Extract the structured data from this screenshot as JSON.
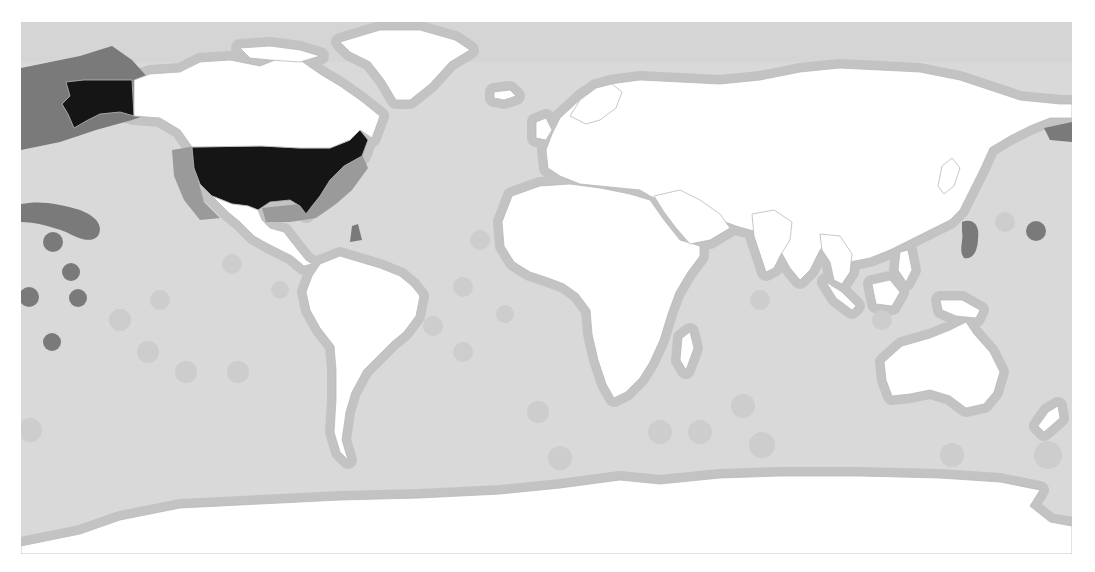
{
  "map": {
    "type": "choropleth-world-map",
    "projection": "equirectangular",
    "frame": {
      "x": 21,
      "y": 22,
      "width": 1051,
      "height": 532
    },
    "colors": {
      "page_background": "#ffffff",
      "ocean_base": "#d9d9d9",
      "arctic_band": "#d2d2d2",
      "eez_light": "#cdcdcd",
      "eez_mid": "#c3c3c3",
      "eez_medium_dark": "#9a9a9a",
      "eez_dark": "#7a7a7a",
      "highlight_land": "#151515",
      "land": "#ffffff",
      "border": "#b9b9b9"
    },
    "legend": null,
    "highlighted_country": "United States",
    "zones": [
      {
        "id": "us-alaska-eez",
        "label": "Alaska EEZ",
        "shade": "eez_dark",
        "d": "M21,68 L80,56 L112,46 L132,60 L150,80 L166,96 L160,110 L132,120 L96,130 L60,142 L21,150 Z"
      },
      {
        "id": "us-west-coast-eez",
        "label": "US West Coast EEZ",
        "shade": "eez_medium_dark",
        "d": "M172,150 L196,146 L198,180 L204,202 L220,218 L200,220 L184,200 L174,176 Z"
      },
      {
        "id": "us-gulf-east-eez",
        "label": "US Gulf & East Coast EEZ",
        "shade": "eez_medium_dark",
        "d": "M262,208 L300,204 L320,196 L330,176 L346,160 L360,150 L368,168 L352,190 L336,204 L316,218 L290,222 L266,222 Z"
      },
      {
        "id": "hawaii-chain-eez",
        "label": "Hawaiian chain EEZ",
        "shade": "eez_dark",
        "d": "M21,204 C40,200 60,204 80,210 C96,216 104,226 98,236 C90,244 78,238 66,232 C50,226 34,222 21,222 Z"
      },
      {
        "id": "puerto-rico-eez",
        "label": "Puerto Rico EEZ",
        "shade": "eez_dark",
        "d": "M352,226 L358,224 L362,240 L350,242 Z"
      },
      {
        "id": "guam-marianas-eez",
        "label": "Guam / Marianas EEZ",
        "shade": "eez_dark",
        "d": "M962,222 C972,218 980,224 978,238 C978,252 972,260 964,258 C958,250 964,240 962,232 Z"
      },
      {
        "id": "bering-eez",
        "label": "Aleutian / Bering EEZ",
        "shade": "eez_dark",
        "d": "M1044,128 L1072,122 L1072,142 L1050,140 Z"
      }
    ],
    "circles": [
      {
        "id": "wake-island",
        "cx": 1036,
        "cy": 231,
        "r": 10,
        "shade": "eez_dark"
      },
      {
        "id": "johnston-atoll",
        "cx": 53,
        "cy": 242,
        "r": 10,
        "shade": "eez_dark"
      },
      {
        "id": "kingman-palmyra",
        "cx": 71,
        "cy": 272,
        "r": 9,
        "shade": "eez_dark"
      },
      {
        "id": "howland-baker",
        "cx": 29,
        "cy": 297,
        "r": 10,
        "shade": "eez_dark"
      },
      {
        "id": "jarvis-island",
        "cx": 78,
        "cy": 298,
        "r": 9,
        "shade": "eez_dark"
      },
      {
        "id": "american-samoa",
        "cx": 52,
        "cy": 342,
        "r": 9,
        "shade": "eez_dark"
      }
    ],
    "light_circles": [
      {
        "cx": 300,
        "cy": 187,
        "r": 12
      },
      {
        "cx": 232,
        "cy": 264,
        "r": 10
      },
      {
        "cx": 280,
        "cy": 290,
        "r": 9
      },
      {
        "cx": 463,
        "cy": 287,
        "r": 10
      },
      {
        "cx": 505,
        "cy": 314,
        "r": 9
      },
      {
        "cx": 463,
        "cy": 352,
        "r": 10
      },
      {
        "cx": 538,
        "cy": 412,
        "r": 11
      },
      {
        "cx": 433,
        "cy": 326,
        "r": 10
      },
      {
        "cx": 238,
        "cy": 372,
        "r": 11
      },
      {
        "cx": 148,
        "cy": 352,
        "r": 11
      },
      {
        "cx": 186,
        "cy": 372,
        "r": 11
      },
      {
        "cx": 660,
        "cy": 432,
        "r": 12
      },
      {
        "cx": 700,
        "cy": 432,
        "r": 12
      },
      {
        "cx": 743,
        "cy": 406,
        "r": 12
      },
      {
        "cx": 762,
        "cy": 445,
        "r": 13
      },
      {
        "cx": 1005,
        "cy": 222,
        "r": 10
      },
      {
        "cx": 882,
        "cy": 320,
        "r": 10
      },
      {
        "cx": 952,
        "cy": 455,
        "r": 12
      },
      {
        "cx": 1048,
        "cy": 455,
        "r": 14
      },
      {
        "cx": 560,
        "cy": 458,
        "r": 12
      },
      {
        "cx": 760,
        "cy": 300,
        "r": 10
      },
      {
        "cx": 620,
        "cy": 290,
        "r": 10
      },
      {
        "cx": 480,
        "cy": 240,
        "r": 10
      },
      {
        "cx": 30,
        "cy": 430,
        "r": 12
      },
      {
        "cx": 120,
        "cy": 320,
        "r": 11
      },
      {
        "cx": 160,
        "cy": 300,
        "r": 10
      }
    ],
    "land": [
      {
        "id": "usa-contiguous",
        "name": "United States",
        "highlight": true,
        "d": "M192,147 L262,146 L300,148 L330,148 L350,140 L360,130 L368,140 L362,156 L344,166 L330,180 L320,196 L312,206 L306,214 L300,206 L290,200 L270,202 L258,210 L248,206 L232,204 L212,196 L200,184 L194,168 Z"
      },
      {
        "id": "usa-alaska",
        "name": "Alaska",
        "highlight": true,
        "d": "M66,82 L84,80 L132,80 L134,116 L120,112 L100,114 L88,120 L74,128 L68,114 L62,104 L70,96 Z"
      },
      {
        "id": "canada",
        "name": "Canada",
        "highlight": false,
        "d": "M134,80 L150,74 L180,72 L200,62 L230,60 L260,66 L280,58 L300,60 L320,74 L340,86 L360,100 L380,116 L372,138 L360,130 L350,140 L330,148 L300,148 L262,146 L192,147 L180,130 L160,118 L134,116 Z"
      },
      {
        "id": "canada-arctic-islands",
        "name": "Canadian Arctic Archipelago",
        "highlight": false,
        "d": "M240,48 L270,46 L300,50 L320,56 L300,62 L270,60 L250,58 Z"
      },
      {
        "id": "greenland",
        "name": "Greenland",
        "highlight": false,
        "d": "M340,42 L380,30 L420,30 L455,40 L470,50 L450,62 L430,84 L410,100 L396,100 L384,80 L370,62 L350,52 Z"
      },
      {
        "id": "mexico-central-america",
        "name": "Mexico & Central America",
        "highlight": false,
        "d": "M212,196 L232,204 L248,206 L258,210 L262,220 L270,228 L284,232 L290,240 L298,250 L306,260 L312,264 L304,266 L292,256 L280,250 L268,244 L254,236 L240,222 L228,212 Z"
      },
      {
        "id": "south-america",
        "name": "South America",
        "highlight": false,
        "d": "M320,264 L340,256 L360,262 L380,268 L400,276 L412,286 L420,296 L416,316 L404,332 L392,342 L378,356 L364,370 L352,392 L346,412 L342,440 L348,460 L340,452 L334,432 L336,400 L336,370 L334,346 L320,328 L310,310 L306,292 L312,276 Z"
      },
      {
        "id": "europe-asia",
        "name": "Eurasia",
        "highlight": false,
        "d": "M560,118 L584,96 L610,84 L640,80 L680,82 L720,84 L760,80 L800,72 L840,68 L880,70 L920,72 L960,80 L990,90 L1020,100 L1060,104 L1072,104 L1072,118 L1050,118 L1030,126 L1010,136 L990,148 L980,170 L970,190 L960,210 L950,220 L930,230 L910,240 L890,250 L870,258 L850,262 L840,250 L830,240 L820,250 L810,270 L800,280 L790,268 L780,250 L770,236 L750,230 L736,226 L720,220 L700,214 L684,212 L668,204 L650,196 L640,190 L620,188 L600,186 L580,184 L560,176 L548,168 L546,150 L552,134 Z"
      },
      {
        "id": "scandinavia",
        "name": "Scandinavia",
        "highlight": false,
        "d": "M570,116 L580,100 L596,88 L612,84 L622,92 L616,108 L600,120 L586,124 Z"
      },
      {
        "id": "uk-ireland",
        "name": "United Kingdom & Ireland",
        "highlight": false,
        "d": "M536,122 L546,118 L552,130 L546,140 L536,138 Z"
      },
      {
        "id": "iceland",
        "name": "Iceland",
        "highlight": false,
        "d": "M494,92 L510,90 L516,96 L504,100 L494,98 Z"
      },
      {
        "id": "africa",
        "name": "Africa",
        "highlight": false,
        "d": "M512,196 L540,186 L570,184 L600,188 L630,194 L650,200 L664,220 L680,240 L700,246 L700,256 L688,272 L676,292 L668,314 L660,340 L650,362 L640,378 L626,392 L614,398 L606,384 L598,360 L592,334 L590,310 L578,294 L564,284 L548,278 L530,272 L514,262 L504,246 L502,222 Z"
      },
      {
        "id": "madagascar",
        "name": "Madagascar",
        "highlight": false,
        "d": "M682,338 L690,332 L694,348 L686,370 L680,360 Z"
      },
      {
        "id": "arabia",
        "name": "Arabian Peninsula",
        "highlight": false,
        "d": "M654,196 L680,190 L700,200 L720,214 L730,228 L710,240 L690,244 L676,228 L664,212 Z"
      },
      {
        "id": "india",
        "name": "India",
        "highlight": false,
        "d": "M752,214 L774,210 L792,222 L790,240 L780,256 L774,268 L766,272 L760,254 L754,236 Z"
      },
      {
        "id": "southeast-asia",
        "name": "Southeast Asia",
        "highlight": false,
        "d": "M820,234 L840,236 L852,254 L850,272 L842,284 L834,280 L830,262 L822,250 Z"
      },
      {
        "id": "indonesia-sumatra",
        "name": "Sumatra",
        "highlight": false,
        "d": "M826,282 L842,292 L856,306 L852,310 L836,298 Z"
      },
      {
        "id": "borneo",
        "name": "Borneo",
        "highlight": false,
        "d": "M872,284 L890,280 L900,292 L892,306 L876,304 Z"
      },
      {
        "id": "philippines",
        "name": "Philippines",
        "highlight": false,
        "d": "M900,252 L908,250 L912,270 L906,282 L898,270 Z"
      },
      {
        "id": "new-guinea",
        "name": "New Guinea",
        "highlight": false,
        "d": "M940,300 L962,300 L980,310 L976,318 L956,316 L942,310 Z"
      },
      {
        "id": "japan",
        "name": "Japan",
        "highlight": false,
        "d": "M942,166 L952,158 L960,168 L954,186 L944,194 L938,186 Z"
      },
      {
        "id": "australia",
        "name": "Australia",
        "highlight": false,
        "d": "M884,362 L902,346 L930,338 L950,330 L966,322 L974,334 L990,352 L1000,372 L994,392 L984,404 L966,408 L950,396 L930,390 L910,394 L892,396 L886,380 Z"
      },
      {
        "id": "new-zealand",
        "name": "New Zealand",
        "highlight": false,
        "d": "M1048,412 L1058,406 L1060,418 L1044,432 L1038,426 Z"
      },
      {
        "id": "antarctica",
        "name": "Antarctica",
        "highlight": false,
        "d": "M21,546 L80,534 L120,520 L180,508 L260,504 L340,500 L420,498 L500,494 L560,488 L620,480 L660,484 L720,478 L780,476 L860,476 L940,478 L1000,482 L1040,490 L1030,506 L1050,522 L1072,526 L1072,554 L21,554 Z"
      }
    ]
  }
}
